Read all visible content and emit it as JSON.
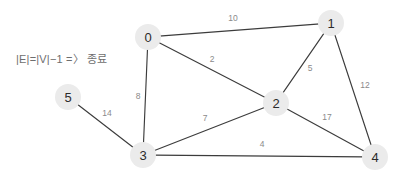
{
  "annotation": {
    "text": "|E|=|V|−1 =〉 종료"
  },
  "colors": {
    "node_fill": "#ebebeb",
    "node_text": "#2b2b2b",
    "edge": "#3c3c3c",
    "weight_text": "#8a8a8a",
    "annotation_text": "#6e6e6e",
    "background": "#ffffff"
  },
  "graph": {
    "nodes": [
      {
        "id": "0",
        "label": "0",
        "x": 148,
        "y": 37,
        "r": 13
      },
      {
        "id": "1",
        "label": "1",
        "x": 331,
        "y": 23,
        "r": 13
      },
      {
        "id": "2",
        "label": "2",
        "x": 276,
        "y": 103,
        "r": 13
      },
      {
        "id": "3",
        "label": "3",
        "x": 143,
        "y": 155,
        "r": 13
      },
      {
        "id": "4",
        "label": "4",
        "x": 375,
        "y": 157,
        "r": 13
      },
      {
        "id": "5",
        "label": "5",
        "x": 68,
        "y": 97,
        "r": 13
      }
    ],
    "edges": [
      {
        "source": "0",
        "target": "1",
        "weight": "10",
        "lx": 233,
        "ly": 18
      },
      {
        "source": "0",
        "target": "2",
        "weight": "2",
        "lx": 212,
        "ly": 59
      },
      {
        "source": "0",
        "target": "3",
        "weight": "8",
        "lx": 138,
        "ly": 96
      },
      {
        "source": "1",
        "target": "2",
        "weight": "5",
        "lx": 310,
        "ly": 68
      },
      {
        "source": "1",
        "target": "4",
        "weight": "12",
        "lx": 365,
        "ly": 85
      },
      {
        "source": "2",
        "target": "3",
        "weight": "7",
        "lx": 205,
        "ly": 118
      },
      {
        "source": "2",
        "target": "4",
        "weight": "17",
        "lx": 327,
        "ly": 117
      },
      {
        "source": "3",
        "target": "4",
        "weight": "4",
        "lx": 262,
        "ly": 144
      },
      {
        "source": "5",
        "target": "3",
        "weight": "14",
        "lx": 107,
        "ly": 113
      }
    ]
  }
}
